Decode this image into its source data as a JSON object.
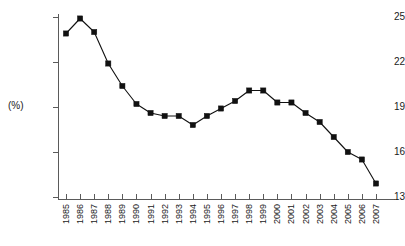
{
  "chart_data": {
    "type": "line",
    "title": "",
    "subtitle": "",
    "xlabel": "",
    "ylabel": "(%)",
    "categories": [
      "1985",
      "1986",
      "1987",
      "1988",
      "1989",
      "1990",
      "1991",
      "1992",
      "1993",
      "1994",
      "1995",
      "1996",
      "1997",
      "1998",
      "1999",
      "2000",
      "2001",
      "2002",
      "2003",
      "2004",
      "2005",
      "2006",
      "2007"
    ],
    "values": [
      23.9,
      24.9,
      24.0,
      21.9,
      20.4,
      19.2,
      18.6,
      18.4,
      18.4,
      17.8,
      18.4,
      18.9,
      19.4,
      20.1,
      20.1,
      19.3,
      19.3,
      18.6,
      18.0,
      17.0,
      16.0,
      15.5,
      13.9
    ],
    "series": [
      {
        "name": "",
        "values": [
          23.9,
          24.9,
          24.0,
          21.9,
          20.4,
          19.2,
          18.6,
          18.4,
          18.4,
          17.8,
          18.4,
          18.9,
          19.4,
          20.1,
          20.1,
          19.3,
          19.3,
          18.6,
          18.0,
          17.0,
          16.0,
          15.5,
          13.9
        ]
      }
    ],
    "ylim": [
      13,
      25
    ],
    "yticks": [
      13,
      16,
      19,
      22,
      25
    ],
    "ytick_labels": [
      "13",
      "16",
      "19",
      "22",
      "25"
    ],
    "xlim": [
      "1985",
      "2007"
    ],
    "grid": false,
    "legend": false,
    "legend_position": "none",
    "marker": "square",
    "line_color": "#111111",
    "marker_color": "#111111",
    "axis_color": "#5a5a5a",
    "background_color": "#ffffff",
    "annotations": []
  }
}
